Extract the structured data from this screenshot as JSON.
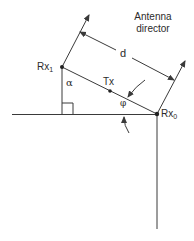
{
  "diagram": {
    "title_line1": "Antenna",
    "title_line2": "director",
    "labels": {
      "rx1": "Rx",
      "rx1_sub": "1",
      "rx0": "Rx",
      "rx0_sub": "0",
      "tx": "Tx",
      "d": "d",
      "alpha": "α",
      "phi": "φ"
    },
    "colors": {
      "line": "#3a3a3a",
      "background": "#ffffff"
    }
  }
}
